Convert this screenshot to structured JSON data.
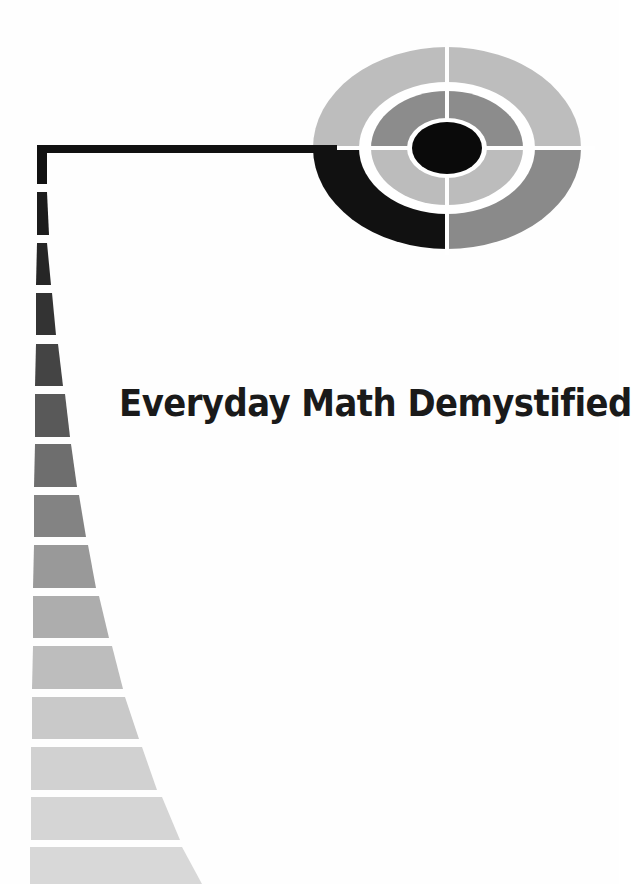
{
  "cover": {
    "title": "Everyday Math Demystified",
    "background_color": "#ffffff",
    "title_color": "#1a1a1a"
  },
  "target_graphic": {
    "center": [
      447,
      148
    ],
    "rings": [
      {
        "name": "outer",
        "rx": 134,
        "ry": 101
      },
      {
        "name": "outer-gap",
        "rx": 88,
        "ry": 66
      },
      {
        "name": "middle",
        "rx": 76,
        "ry": 57
      },
      {
        "name": "inner-gap",
        "rx": 40,
        "ry": 30
      },
      {
        "name": "bullseye",
        "rx": 35,
        "ry": 26
      }
    ],
    "colors": {
      "outer_top_left": "#bdbdbd",
      "outer_top_right": "#bdbdbd",
      "outer_bottom_left": "#111111",
      "outer_bottom_right": "#8a8a8a",
      "middle_top_left": "#8c8c8c",
      "middle_top_right": "#8c8c8c",
      "middle_bottom_left": "#bcbcbc",
      "middle_bottom_right": "#bcbcbc",
      "bullseye": "#0a0a0a",
      "divider": "#ffffff"
    }
  },
  "connector_line": {
    "color": "#111111",
    "points": [
      [
        37,
        145
      ],
      [
        330,
        145
      ]
    ],
    "vertical_drop_to": 184
  },
  "staircase_bars": [
    {
      "top": 192,
      "bottom": 235,
      "left_top": 37,
      "left_bottom": 37,
      "right_top": 47,
      "right_bottom": 49,
      "color": "#1c1c1c"
    },
    {
      "top": 243,
      "bottom": 285,
      "left_top": 37,
      "left_bottom": 36,
      "right_top": 47,
      "right_bottom": 51,
      "color": "#262626"
    },
    {
      "top": 293,
      "bottom": 335,
      "left_top": 36,
      "left_bottom": 36,
      "right_top": 52,
      "right_bottom": 56,
      "color": "#333333"
    },
    {
      "top": 344,
      "bottom": 386,
      "left_top": 36,
      "left_bottom": 35,
      "right_top": 58,
      "right_bottom": 63,
      "color": "#444444"
    },
    {
      "top": 394,
      "bottom": 437,
      "left_top": 35,
      "left_bottom": 35,
      "right_top": 65,
      "right_bottom": 70,
      "color": "#595959"
    },
    {
      "top": 444,
      "bottom": 487,
      "left_top": 35,
      "left_bottom": 34,
      "right_top": 71,
      "right_bottom": 77,
      "color": "#6e6e6e"
    },
    {
      "top": 495,
      "bottom": 537,
      "left_top": 34,
      "left_bottom": 34,
      "right_top": 79,
      "right_bottom": 86,
      "color": "#838383"
    },
    {
      "top": 545,
      "bottom": 588,
      "left_top": 34,
      "left_bottom": 33,
      "right_top": 88,
      "right_bottom": 96,
      "color": "#999999"
    },
    {
      "top": 596,
      "bottom": 638,
      "left_top": 33,
      "left_bottom": 33,
      "right_top": 99,
      "right_bottom": 109,
      "color": "#adadad"
    },
    {
      "top": 646,
      "bottom": 689,
      "left_top": 33,
      "left_bottom": 32,
      "right_top": 112,
      "right_bottom": 123,
      "color": "#bdbdbd"
    },
    {
      "top": 697,
      "bottom": 739,
      "left_top": 32,
      "left_bottom": 32,
      "right_top": 125,
      "right_bottom": 139,
      "color": "#c9c9c9"
    },
    {
      "top": 747,
      "bottom": 790,
      "left_top": 31,
      "left_bottom": 31,
      "right_top": 142,
      "right_bottom": 157,
      "color": "#d1d1d1"
    },
    {
      "top": 797,
      "bottom": 840,
      "left_top": 31,
      "left_bottom": 31,
      "right_top": 162,
      "right_bottom": 180,
      "color": "#d5d5d5"
    },
    {
      "top": 847,
      "bottom": 884,
      "left_top": 30,
      "left_bottom": 30,
      "right_top": 182,
      "right_bottom": 202,
      "color": "#d8d8d8"
    }
  ]
}
